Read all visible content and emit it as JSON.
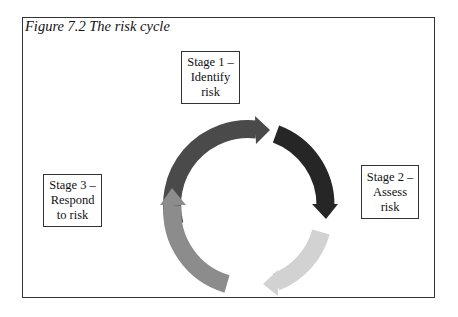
{
  "figure": {
    "caption": "Figure 7.2  The risk cycle"
  },
  "stages": [
    {
      "id": "stage-1",
      "label": "Stage 1 –\nIdentify\nrisk"
    },
    {
      "id": "stage-2",
      "label": "Stage 2 –\nAssess\nrisk"
    },
    {
      "id": "stage-3",
      "label": "Stage 3 –\nRespond\nto risk"
    }
  ],
  "arrows": [
    {
      "name": "arrow-identify",
      "color": "#4a4a4a"
    },
    {
      "name": "arrow-assess",
      "color": "#262626"
    },
    {
      "name": "arrow-light",
      "color": "#d2d2d2"
    },
    {
      "name": "arrow-respond",
      "color": "#8c8c8c"
    }
  ]
}
